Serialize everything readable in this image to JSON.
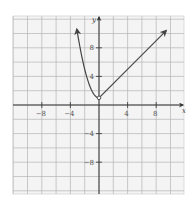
{
  "chart_data": {
    "type": "line",
    "title": "",
    "xlabel": "x",
    "ylabel": "y",
    "xlim": [
      -12,
      12
    ],
    "ylim": [
      -12.5,
      12.4
    ],
    "grid": true,
    "grid_step": 2,
    "x_ticks": [
      -8,
      -4,
      4,
      8
    ],
    "y_ticks": [
      8,
      4,
      -4,
      -8
    ],
    "x_tick_labels": [
      "−8",
      "−4",
      "4",
      "8"
    ],
    "y_tick_labels": [
      "8",
      "4",
      "−4",
      "−8"
    ],
    "series": [
      {
        "name": "left branch",
        "description": "y = x^2 + 1 for x < 0 (arrow at upper end)",
        "x": [
          -3.1,
          -3,
          -2.5,
          -2,
          -1.5,
          -1,
          -0.5,
          0
        ],
        "y": [
          10.6,
          10,
          7.25,
          5,
          3.25,
          2,
          1.25,
          1
        ]
      },
      {
        "name": "right branch",
        "description": "y = x + 1 for x >= 0 (arrow at upper end)",
        "x": [
          0,
          9.4
        ],
        "y": [
          1,
          10.4
        ]
      }
    ],
    "special_points": [
      {
        "x": 0,
        "y": 1,
        "style": "open-circle-junction"
      }
    ],
    "colors": {
      "grid": "#b5b5b5",
      "axis": "#333333",
      "curve": "#444444",
      "background": "#f4f4f4"
    }
  }
}
